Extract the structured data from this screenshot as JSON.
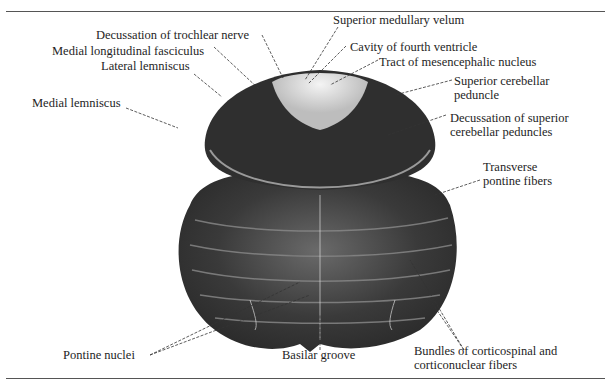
{
  "figure": {
    "labels": {
      "decussation_trochlear": "Decussation of trochlear nerve",
      "superior_medullary_velum": "Superior medullary velum",
      "medial_longitudinal_fasciculus": "Medial longitudinal fasciculus",
      "cavity_fourth_ventricle": "Cavity of fourth ventricle",
      "lateral_lemniscus": "Lateral lemniscus",
      "tract_mesencephalic": "Tract of mesencephalic nucleus",
      "superior_cerebellar_peduncle_1": "Superior cerebellar",
      "superior_cerebellar_peduncle_2": "peduncle",
      "medial_lemniscus": "Medial lemniscus",
      "decussation_scp_1": "Decussation of superior",
      "decussation_scp_2": "cerebellar peduncles",
      "transverse_pontine_1": "Transverse",
      "transverse_pontine_2": "pontine fibers",
      "pontine_nuclei": "Pontine nuclei",
      "basilar_groove": "Basilar groove",
      "bundles_1": "Bundles of corticospinal and",
      "bundles_2": "corticonuclear fibers"
    }
  }
}
